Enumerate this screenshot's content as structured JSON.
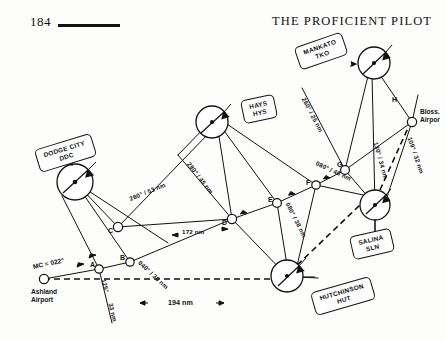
{
  "page": {
    "folio": "184",
    "running_head": "THE PROFICIENT PILOT"
  },
  "figure": {
    "type": "vor-navigation-route-diagram",
    "stations": [
      {
        "id": "ddc",
        "name": "DODGE CITY",
        "ident": "DDC"
      },
      {
        "id": "hys",
        "name": "HAYS",
        "ident": "HYS"
      },
      {
        "id": "tko",
        "name": "MANKATO",
        "ident": "TKO"
      },
      {
        "id": "sln",
        "name": "SALINA",
        "ident": "SLN"
      },
      {
        "id": "hut",
        "name": "HUTCHINSON",
        "ident": "HUT"
      }
    ],
    "airports": [
      {
        "id": "ashland",
        "line1": "Ashland",
        "line2": "Airport"
      },
      {
        "id": "blosser",
        "line1": "Bloss.",
        "line2": "Airpor"
      }
    ],
    "fixes": [
      "A",
      "B",
      "C",
      "D",
      "E",
      "F",
      "G",
      "H"
    ],
    "radials": [
      {
        "id": "r1",
        "text": "260° / 53 nm"
      },
      {
        "id": "r2",
        "text": "280° / 45 nm"
      },
      {
        "id": "r3",
        "text": "260° / 25 nm"
      },
      {
        "id": "r4",
        "text": "080° / 38 nm"
      },
      {
        "id": "r5",
        "text": "080° / 46 nm"
      },
      {
        "id": "r6",
        "text": "040° / 35 nm"
      },
      {
        "id": "r7",
        "text": "109° / 32 nm"
      },
      {
        "id": "r8",
        "text": "130° / 34 nm"
      },
      {
        "id": "r9",
        "text": "125°"
      },
      {
        "id": "r10",
        "text": "33 nm"
      }
    ],
    "annotations": [
      {
        "id": "mc",
        "text": "MC = 022°"
      },
      {
        "id": "total",
        "text": "194 nm"
      },
      {
        "id": "seg172",
        "text": "172 nm"
      }
    ]
  }
}
